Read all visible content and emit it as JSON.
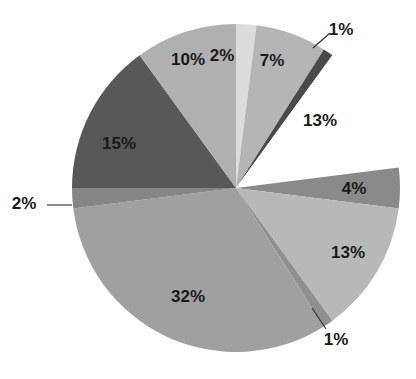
{
  "chart_data": {
    "type": "pie",
    "title": "",
    "subtitle": "",
    "xlabel": "",
    "ylabel": "",
    "legend_position": "none",
    "grid": false,
    "value_unit": "%",
    "total": 100,
    "start_angle_deg": 0,
    "direction": "clockwise",
    "center": {
      "x": 236,
      "y": 188
    },
    "radius": 164,
    "categories": [
      "Slice 1",
      "Slice 2",
      "Slice 3",
      "Slice 4",
      "Slice 5",
      "Slice 6",
      "Slice 7",
      "Slice 8",
      "Slice 9",
      "Slice 10",
      "Slice 11"
    ],
    "values": [
      2,
      7,
      1,
      13,
      4,
      13,
      1,
      32,
      2,
      15,
      10
    ],
    "labels": [
      "2%",
      "7%",
      "1%",
      "13%",
      "4%",
      "13%",
      "1%",
      "32%",
      "2%",
      "15%",
      "10%"
    ],
    "colors": [
      "#dcdcdc",
      "#b5b5b5",
      "#4a4a4a",
      "#ffffff",
      "#8a8a8a",
      "#b8b8b8",
      "#8f8f8f",
      "#a0a0a0",
      "#868686",
      "#585858",
      "#b0b0b0"
    ],
    "slices": [
      {
        "label": "2%",
        "value": 2,
        "color": "#dcdcdc",
        "label_placement": "inside",
        "label_x": 222,
        "label_y": 57
      },
      {
        "label": "7%",
        "value": 7,
        "color": "#b5b5b5",
        "label_placement": "inside",
        "label_x": 272,
        "label_y": 62
      },
      {
        "label": "1%",
        "value": 1,
        "color": "#4a4a4a",
        "label_placement": "outside",
        "label_x": 341,
        "label_y": 31
      },
      {
        "label": "13%",
        "value": 13,
        "color": "#ffffff",
        "label_placement": "inside",
        "label_x": 320,
        "label_y": 122
      },
      {
        "label": "4%",
        "value": 4,
        "color": "#8a8a8a",
        "label_placement": "inside",
        "label_x": 354,
        "label_y": 190
      },
      {
        "label": "13%",
        "value": 13,
        "color": "#b8b8b8",
        "label_placement": "inside",
        "label_x": 348,
        "label_y": 254
      },
      {
        "label": "1%",
        "value": 1,
        "color": "#8f8f8f",
        "label_placement": "outside",
        "label_x": 336,
        "label_y": 341
      },
      {
        "label": "32%",
        "value": 32,
        "color": "#a0a0a0",
        "label_placement": "inside",
        "label_x": 188,
        "label_y": 298
      },
      {
        "label": "2%",
        "value": 2,
        "color": "#868686",
        "label_placement": "outside",
        "label_x": 24,
        "label_y": 205
      },
      {
        "label": "15%",
        "value": 15,
        "color": "#585858",
        "label_placement": "inside",
        "label_x": 119,
        "label_y": 145
      },
      {
        "label": "10%",
        "value": 10,
        "color": "#b0b0b0",
        "label_placement": "inside",
        "label_x": 188,
        "label_y": 61
      }
    ],
    "leader_lines": [
      {
        "for": "1%",
        "x1": 313,
        "y1": 48,
        "x2": 330,
        "y2": 33
      },
      {
        "for": "1%",
        "x1": 312,
        "y1": 308,
        "x2": 326,
        "y2": 329
      },
      {
        "for": "2%",
        "x1": 72,
        "y1": 205,
        "x2": 47,
        "y2": 205
      }
    ]
  }
}
